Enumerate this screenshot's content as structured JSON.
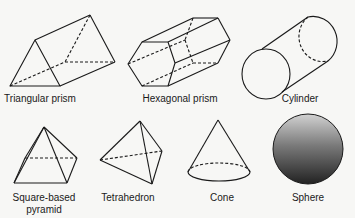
{
  "shapes": [
    {
      "id": "triangular-prism",
      "label": "Triangular prism"
    },
    {
      "id": "hexagonal-prism",
      "label": "Hexagonal prism"
    },
    {
      "id": "cylinder",
      "label": "Cylinder"
    },
    {
      "id": "square-based-pyramid",
      "label_line1": "Square-based",
      "label_line2": "pyramid"
    },
    {
      "id": "tetrahedron",
      "label": "Tetrahedron"
    },
    {
      "id": "cone",
      "label": "Cone"
    },
    {
      "id": "sphere",
      "label": "Sphere"
    }
  ],
  "colors": {
    "stroke": "#1a1a1a",
    "sphere_top": "#cfcfcf",
    "sphere_bottom": "#262626",
    "background": "#f7f7f5"
  }
}
